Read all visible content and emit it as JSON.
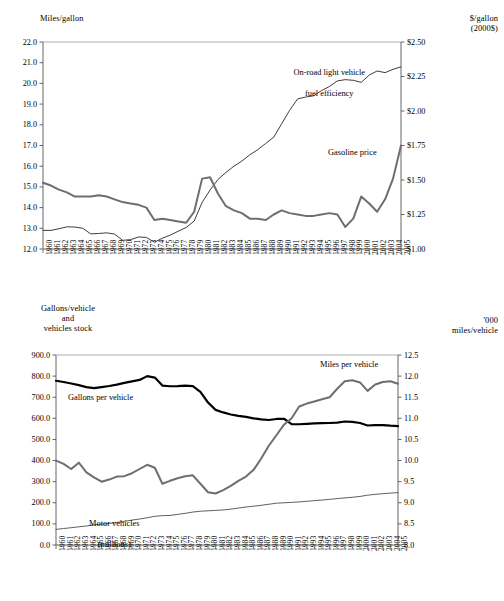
{
  "chart_data": [
    {
      "id": "top",
      "type": "line",
      "title": "",
      "xlabel": "",
      "ylabel": "Miles/gallon",
      "y2label": "$/gallon\n(2000$)",
      "grid": false,
      "legend_position": "inline-annotations",
      "x": [
        1960,
        1961,
        1962,
        1963,
        1964,
        1965,
        1966,
        1967,
        1968,
        1969,
        1970,
        1971,
        1972,
        1973,
        1974,
        1975,
        1976,
        1977,
        1978,
        1979,
        1980,
        1981,
        1982,
        1983,
        1984,
        1985,
        1986,
        1987,
        1988,
        1989,
        1990,
        1991,
        1992,
        1993,
        1994,
        1995,
        1996,
        1997,
        1998,
        1999,
        2000,
        2001,
        2002,
        2003,
        2004,
        2005
      ],
      "xtick_labels": [
        "1960",
        "1961",
        "1962",
        "1963",
        "1964",
        "1965",
        "1966",
        "1967",
        "1968",
        "1969",
        "1970",
        "1971",
        "1972",
        "1973",
        "1974",
        "1975",
        "1976",
        "1977",
        "1978",
        "1979",
        "1980",
        "1981",
        "1982",
        "1983",
        "1984",
        "1985",
        "1986",
        "1987",
        "1988",
        "1989",
        "1990",
        "1991",
        "1992",
        "1993",
        "1994",
        "1995",
        "1996",
        "1997",
        "1998",
        "1999",
        "2000",
        "2001",
        "2002",
        "2003",
        "2004",
        "2005"
      ],
      "ylim": [
        12.0,
        22.0
      ],
      "ytick_labels": [
        "22.0",
        "21.0",
        "20.0",
        "19.0",
        "18.0",
        "17.0",
        "16.0",
        "15.0",
        "14.0",
        "13.0",
        "12.0"
      ],
      "ytick_values": [
        22.0,
        21.0,
        20.0,
        19.0,
        18.0,
        17.0,
        16.0,
        15.0,
        14.0,
        13.0,
        12.0
      ],
      "y2lim": [
        1.0,
        2.5
      ],
      "y2tick_labels": [
        "$2.50",
        "$2.25",
        "$2.00",
        "$1.75",
        "$1.50",
        "$1.25",
        "$1.00"
      ],
      "y2tick_values": [
        2.5,
        2.25,
        2.0,
        1.75,
        1.5,
        1.25,
        1.0
      ],
      "series": [
        {
          "name": "On-road light vehicle fuel efficiency",
          "axis": "left",
          "color": "#3d3d3d",
          "width": 1.0,
          "values": [
            12.9,
            12.9,
            12.98,
            13.07,
            13.06,
            13.0,
            12.73,
            12.75,
            12.78,
            12.72,
            12.42,
            12.45,
            12.58,
            12.56,
            12.33,
            12.52,
            12.67,
            12.86,
            13.04,
            13.35,
            14.25,
            14.85,
            15.36,
            15.7,
            16.0,
            16.25,
            16.55,
            16.8,
            17.1,
            17.4,
            18.05,
            18.7,
            19.25,
            19.34,
            19.4,
            19.65,
            19.85,
            20.12,
            20.18,
            20.15,
            20.05,
            20.4,
            20.6,
            20.52,
            20.68,
            20.8
          ]
        },
        {
          "name": "Gasoline price",
          "axis": "right",
          "color": "#6e6e6e",
          "width": 2.0,
          "values": [
            1.48,
            1.46,
            1.43,
            1.41,
            1.38,
            1.38,
            1.38,
            1.39,
            1.38,
            1.36,
            1.34,
            1.33,
            1.32,
            1.3,
            1.21,
            1.22,
            1.21,
            1.2,
            1.19,
            1.27,
            1.51,
            1.52,
            1.4,
            1.31,
            1.28,
            1.26,
            1.22,
            1.22,
            1.21,
            1.25,
            1.28,
            1.26,
            1.25,
            1.24,
            1.24,
            1.25,
            1.26,
            1.25,
            1.16,
            1.22,
            1.38,
            1.33,
            1.27,
            1.36,
            1.51,
            1.75
          ]
        }
      ],
      "annotations": [
        {
          "text": "On-road light vehicle\nfuel efficiency",
          "x": 320,
          "y": 60
        },
        {
          "text": "Gasoline price",
          "x": 400,
          "y": 150
        }
      ]
    },
    {
      "id": "bottom",
      "type": "line",
      "title": "",
      "xlabel": "",
      "ylabel": "Gallons/vehicle\nand\nvehicles stock",
      "y2label": "'000\nmiles/vehicle",
      "grid": false,
      "legend_position": "inline-annotations",
      "x": [
        1960,
        1961,
        1962,
        1963,
        1964,
        1965,
        1966,
        1967,
        1968,
        1969,
        1970,
        1971,
        1972,
        1973,
        1974,
        1975,
        1976,
        1977,
        1978,
        1979,
        1980,
        1981,
        1982,
        1983,
        1984,
        1985,
        1986,
        1987,
        1988,
        1989,
        1990,
        1991,
        1992,
        1993,
        1994,
        1995,
        1996,
        1997,
        1998,
        1999,
        2000,
        2001,
        2002,
        2003,
        2004,
        2005
      ],
      "xtick_labels": [
        "1960",
        "1961",
        "1962",
        "1963",
        "1964",
        "1965",
        "1966",
        "1967",
        "1968",
        "1969",
        "1970",
        "1971",
        "1972",
        "1973",
        "1974",
        "1975",
        "1976",
        "1977",
        "1978",
        "1979",
        "1980",
        "1981",
        "1982",
        "1983",
        "1984",
        "1985",
        "1986",
        "1987",
        "1988",
        "1989",
        "1990",
        "1991",
        "1992",
        "1993",
        "1994",
        "1995",
        "1996",
        "1997",
        "1998",
        "1999",
        "2000",
        "2001",
        "2002",
        "2003",
        "2004",
        "2005"
      ],
      "ylim": [
        0.0,
        900.0
      ],
      "ytick_labels": [
        "900.0",
        "800.0",
        "700.0",
        "600.0",
        "500.0",
        "400.0",
        "300.0",
        "200.0",
        "100.0",
        "0.0"
      ],
      "ytick_values": [
        900.0,
        800.0,
        700.0,
        600.0,
        500.0,
        400.0,
        300.0,
        200.0,
        100.0,
        0.0
      ],
      "y2lim": [
        8.0,
        12.5
      ],
      "y2tick_labels": [
        "12.5",
        "12.0",
        "11.5",
        "11.0",
        "10.5",
        "10.0",
        "9.5",
        "9.0",
        "8.5",
        "8.0"
      ],
      "y2tick_values": [
        12.5,
        12.0,
        11.5,
        11.0,
        10.5,
        10.0,
        9.5,
        9.0,
        8.5,
        8.0
      ],
      "series": [
        {
          "name": "Gallons per vehicle",
          "axis": "left",
          "color": "#000000",
          "width": 2.2,
          "values": [
            778,
            772,
            765,
            757,
            748,
            743,
            748,
            753,
            760,
            768,
            775,
            782,
            800,
            793,
            755,
            752,
            753,
            755,
            753,
            725,
            675,
            640,
            628,
            618,
            612,
            607,
            600,
            595,
            592,
            597,
            598,
            573,
            572,
            574,
            576,
            577,
            578,
            580,
            585,
            583,
            578,
            566,
            568,
            568,
            565,
            563
          ]
        },
        {
          "name": "Miles per vehicle",
          "axis": "right",
          "color": "#6e6e6e",
          "width": 2.0,
          "values": [
            10.0,
            9.92,
            9.8,
            9.95,
            9.72,
            9.6,
            9.5,
            9.55,
            9.62,
            9.63,
            9.7,
            9.8,
            9.9,
            9.83,
            9.45,
            9.52,
            9.58,
            9.63,
            9.65,
            9.45,
            9.25,
            9.22,
            9.3,
            9.4,
            9.52,
            9.62,
            9.78,
            10.05,
            10.35,
            10.6,
            10.85,
            11.0,
            11.28,
            11.35,
            11.4,
            11.45,
            11.5,
            11.7,
            11.88,
            11.9,
            11.85,
            11.65,
            11.8,
            11.86,
            11.88,
            11.82
          ]
        },
        {
          "name": "Motor vehicles (millions)",
          "axis": "left",
          "color": "#4d4d4d",
          "width": 0.9,
          "values": [
            74,
            78,
            82,
            86,
            90,
            95,
            99,
            102,
            107,
            112,
            118,
            123,
            129,
            136,
            139,
            140,
            145,
            150,
            156,
            160,
            162,
            164,
            166,
            170,
            175,
            180,
            184,
            188,
            193,
            198,
            200,
            202,
            204,
            207,
            210,
            213,
            216,
            220,
            223,
            226,
            230,
            236,
            240,
            243,
            246,
            248
          ]
        }
      ],
      "annotations": [
        {
          "text": "Gallons per vehicle",
          "x": 120,
          "y": 397
        },
        {
          "text": "Miles per vehicle",
          "x": 385,
          "y": 365
        },
        {
          "text": "Motor vehicles\n(millions)",
          "x": 110,
          "y": 512
        }
      ]
    }
  ],
  "panels": {
    "top": {
      "left_axis_title": "Miles/gallon",
      "right_axis_title_line1": "$/gallon",
      "right_axis_title_line2": "(2000$)",
      "annotation_efficiency_line1": "On-road light vehicle",
      "annotation_efficiency_line2": "fuel efficiency",
      "annotation_gasoline": "Gasoline price"
    },
    "bottom": {
      "left_axis_title_line1": "Gallons/vehicle",
      "left_axis_title_line2": "and",
      "left_axis_title_line3": "vehicles stock",
      "right_axis_title_line1": "'000",
      "right_axis_title_line2": "miles/vehicle",
      "annotation_gallons": "Gallons per vehicle",
      "annotation_miles": "Miles per vehicle",
      "annotation_vehicles_line1": "Motor vehicles",
      "annotation_vehicles_line2": "(millions)"
    }
  }
}
